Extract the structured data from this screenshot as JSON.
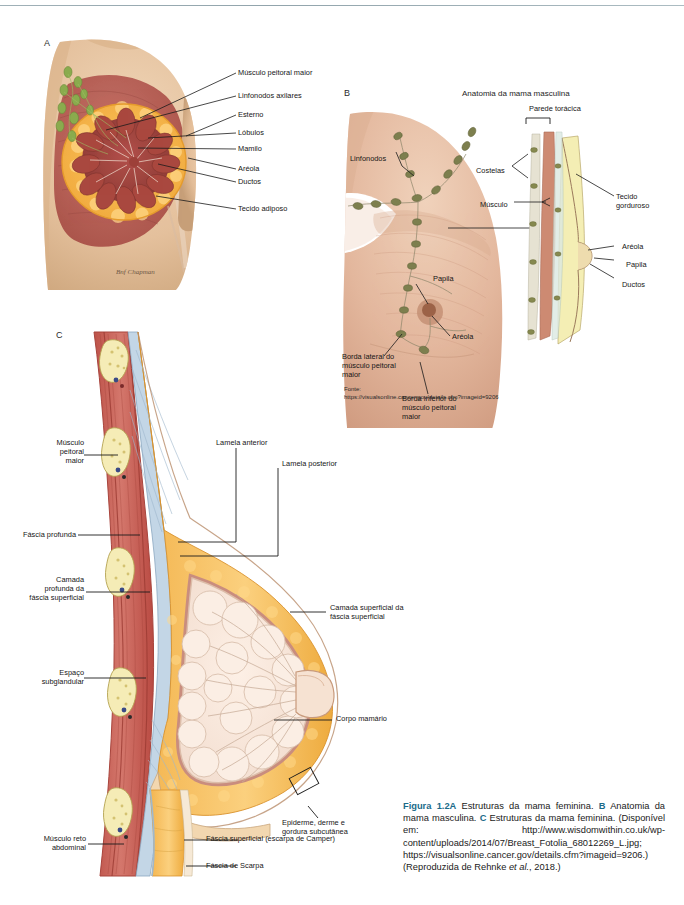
{
  "figure": {
    "panel_a_letter": "A",
    "panel_b_letter": "B",
    "panel_c_letter": "C",
    "panel_b_title": "Anatomia da mama masculina",
    "artist_signature": "Bnf Chapman"
  },
  "panel_a": {
    "labels": [
      "Músculo peitoral maior",
      "Linfonodos axilares",
      "Esterno",
      "Lóbulos",
      "Mamilo",
      "Aréola",
      "Ductos",
      "Tecido adiposo"
    ]
  },
  "panel_b": {
    "title": "Anatomia da mama masculina",
    "labels": {
      "lymph_nodes": "Linfonodos",
      "papilla": "Papila",
      "areola": "Aréola",
      "lateral_border": "Borda lateral do\nmúsculo peitoral\nmaior",
      "inferior_border": "Borda inferior do\nmúsculo peitoral\nmaior"
    },
    "inset_labels": {
      "chest_wall": "Parede torácica",
      "ribs": "Costelas",
      "muscle": "Músculo",
      "fatty_tissue": "Tecido\ngorduroso",
      "areola": "Aréola",
      "papilla": "Papila",
      "ducts": "Ductos"
    },
    "source_label": "Fonte:",
    "source_url": "https://visualsonline.cancer.gov/details.cfm?imageid=9206"
  },
  "panel_c": {
    "labels": {
      "pectoral_muscle": "Músculo\npeitoral\nmaior",
      "deep_fascia": "Fáscia profunda",
      "deep_layer": "Camada\nprofunda da\nfáscia superficial",
      "subglandular_space": "Espaço\nsubglandular",
      "rectus_abdominis": "Músculo reto\nabdominal",
      "anterior_lamella": "Lamela anterior",
      "posterior_lamella": "Lamela posterior",
      "superficial_layer": "Camada superficial da\nfáscia superficial",
      "mammary_body": "Corpo mamário",
      "epidermis": "Epiderme, derme e\ngordura subcutânea",
      "superficial_fascia": "Fáscia superficial (escarpa de Camper)",
      "scarpa_fascia": "Fáscia de Scarpa"
    }
  },
  "caption": {
    "fig_number": "Figura 1.2A",
    "text_a": " Estruturas da mama feminina. ",
    "letter_b": "B",
    "text_b": " Anatomia da mama masculina. ",
    "letter_c": "C",
    "text_c": " Estruturas da mama feminina. (Disponível em: http://www.wisdomwithin.co.uk/wp-content/uploads/2014/07/Breast_Fotolia_68012269_L.jpg; https://visualsonline.cancer.gov/details.cfm?imageid=9206.) (Reproduzida de Rehnke ",
    "italic_ref": "et al.",
    "text_d": ", 2018.)"
  },
  "colors": {
    "accent_teal": "#1b6b8a",
    "muscle_red": "#c4554e",
    "adipose_orange": "#f2b04a",
    "gland_cream": "#f6e4d8",
    "fascia_blue": "#b9cfe0",
    "skin": "#e8c9a8",
    "node_olive": "#7d7f4e",
    "rule_grey": "#8fa3ab"
  }
}
